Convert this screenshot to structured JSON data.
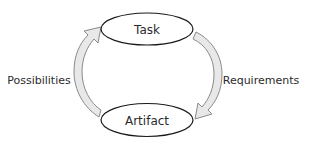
{
  "diagram": {
    "type": "cycle",
    "nodes": [
      {
        "id": "task",
        "label": "Task"
      },
      {
        "id": "artifact",
        "label": "Artifact"
      }
    ],
    "edges": [
      {
        "from": "task",
        "to": "artifact",
        "label": "Requirements",
        "side": "right"
      },
      {
        "from": "artifact",
        "to": "task",
        "label": "Possibilities",
        "side": "left"
      }
    ]
  },
  "colors": {
    "ellipse_stroke": "#1a1a1a",
    "arrow_fill": "#e8e8e8",
    "arrow_stroke": "#8a8a8a",
    "text": "#2b2b2b"
  }
}
